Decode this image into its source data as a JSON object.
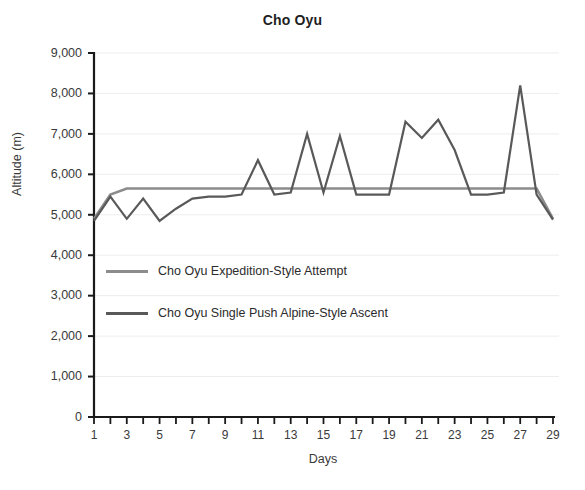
{
  "chart_data": {
    "type": "line",
    "title": "Cho Oyu",
    "xlabel": "Days",
    "ylabel": "Altitude (m)",
    "xlim": [
      1,
      29
    ],
    "ylim": [
      0,
      9000
    ],
    "ytick_step": 1000,
    "grid": true,
    "legend_position": "inside-left",
    "x": [
      1,
      2,
      3,
      4,
      5,
      6,
      7,
      8,
      9,
      10,
      11,
      12,
      13,
      14,
      15,
      16,
      17,
      18,
      19,
      20,
      21,
      22,
      23,
      24,
      25,
      26,
      27,
      28,
      29
    ],
    "xtick_labels": [
      "1",
      "3",
      "5",
      "7",
      "9",
      "11",
      "13",
      "15",
      "17",
      "19",
      "21",
      "23",
      "25",
      "27",
      "29"
    ],
    "ytick_labels": [
      "0",
      "1,000",
      "2,000",
      "3,000",
      "4,000",
      "5,000",
      "6,000",
      "7,000",
      "8,000",
      "9,000"
    ],
    "series": [
      {
        "name": "Cho Oyu Expedition-Style Attempt",
        "color": "#8c8c8c",
        "values": [
          4900,
          5500,
          5650,
          5650,
          5650,
          5650,
          5650,
          5650,
          5650,
          5650,
          5650,
          5650,
          5650,
          5650,
          5650,
          5650,
          5650,
          5650,
          5650,
          5650,
          5650,
          5650,
          5650,
          5650,
          5650,
          5650,
          5650,
          5650,
          4900
        ]
      },
      {
        "name": "Cho Oyu Single Push Alpine-Style Ascent",
        "color": "#595959",
        "values": [
          4850,
          5450,
          4900,
          5400,
          4850,
          5150,
          5400,
          5450,
          5450,
          5500,
          6350,
          5500,
          5550,
          7000,
          5550,
          6950,
          5500,
          5500,
          5500,
          7300,
          6900,
          7350,
          6600,
          5500,
          5500,
          5550,
          8200,
          5500,
          4880
        ]
      }
    ]
  },
  "legend": {
    "items": [
      {
        "label": "Cho Oyu Expedition-Style Attempt",
        "color": "#8c8c8c"
      },
      {
        "label": "Cho Oyu Single Push Alpine-Style Ascent",
        "color": "#595959"
      }
    ]
  }
}
